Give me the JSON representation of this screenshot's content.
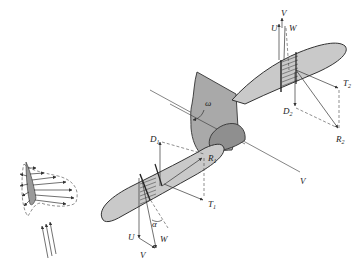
{
  "diagram": {
    "colors": {
      "blade": "#c9c9c9",
      "hub": "#a9a9a9",
      "spinner": "#8f8f8f",
      "line": "#333333",
      "background": "#ffffff"
    },
    "labels": {
      "omega": "ω",
      "axis_V": "V",
      "upper_section": {
        "U": "U",
        "V": "V",
        "W": "W",
        "D": "D",
        "D_sub": "2",
        "T": "T",
        "T_sub": "2",
        "R": "R",
        "R_sub": "2"
      },
      "lower_section": {
        "D": "D",
        "D_sub": "1",
        "R": "R",
        "R_sub": "1",
        "T": "T",
        "T_sub": "1",
        "alpha": "α",
        "U": "U",
        "W": "W",
        "V": "V"
      }
    },
    "inset": {
      "description": "Airfoil pressure distribution with incoming flow arrows",
      "flow_arrows": 3
    }
  }
}
